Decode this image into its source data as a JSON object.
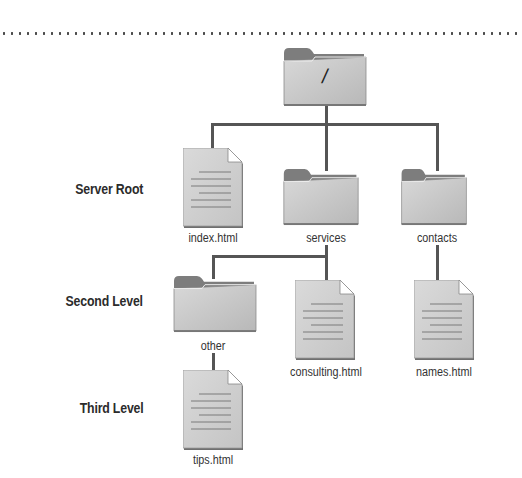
{
  "levels": {
    "server_root": "Server Root",
    "second_level": "Second Level",
    "third_level": "Third Level"
  },
  "tree": {
    "root": {
      "label": "/",
      "type": "folder"
    },
    "server_root_items": [
      {
        "label": "index.html",
        "type": "file"
      },
      {
        "label": "services",
        "type": "folder"
      },
      {
        "label": "contacts",
        "type": "folder"
      }
    ],
    "second_level_items": [
      {
        "label": "other",
        "type": "folder",
        "parent": "services"
      },
      {
        "label": "consulting.html",
        "type": "file",
        "parent": "services"
      },
      {
        "label": "names.html",
        "type": "file",
        "parent": "contacts"
      }
    ],
    "third_level_items": [
      {
        "label": "tips.html",
        "type": "file",
        "parent": "other"
      }
    ]
  },
  "colors": {
    "connector": "#555555",
    "folder_front": "#c9c9c9",
    "folder_back": "#7a7a7a",
    "document": "#d0d0d0"
  }
}
